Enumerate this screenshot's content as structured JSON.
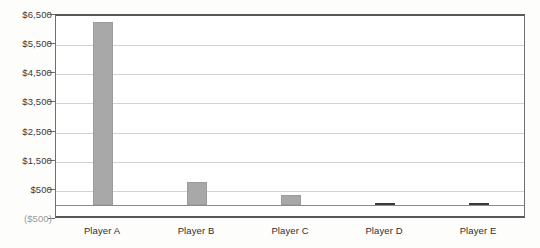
{
  "chart_data": {
    "type": "bar",
    "title": "",
    "xlabel": "",
    "ylabel": "",
    "categories": [
      "Player A",
      "Player B",
      "Player C",
      "Player D",
      "Player E"
    ],
    "values": [
      6300,
      800,
      350,
      100,
      30
    ],
    "ylim": [
      -500,
      6500
    ],
    "ytick_values": [
      6500,
      5500,
      4500,
      3500,
      2500,
      1500,
      500,
      -500
    ],
    "ytick_labels": [
      "$6,500",
      "$5,500",
      "$4,500",
      "$3,500",
      "$2,500",
      "$1,500",
      "$500",
      "($500)"
    ],
    "grid": true,
    "legend": "none",
    "bar_color": "#a8a8a8",
    "bar_color_dark": "#4a4a4a",
    "axis_color": "#58585a",
    "gridline_color": "#d2d2d2",
    "zero_line_value": 0
  }
}
